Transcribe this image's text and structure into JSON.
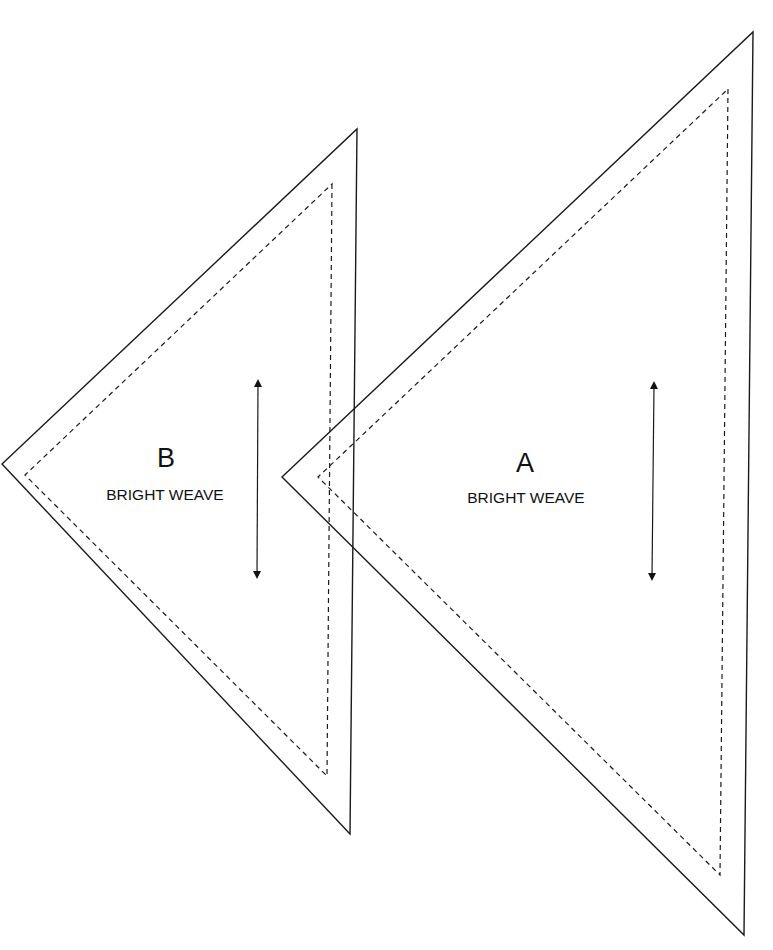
{
  "pieces": [
    {
      "id": "B",
      "letter": "B",
      "fabric": "BRIGHT WEAVE"
    },
    {
      "id": "A",
      "letter": "A",
      "fabric": "BRIGHT WEAVE"
    }
  ]
}
